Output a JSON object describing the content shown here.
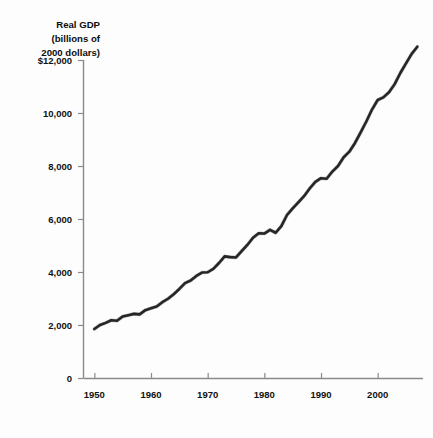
{
  "chart_data": {
    "type": "line",
    "title": "",
    "axis_title_lines": [
      "Real GDP",
      "(billions of",
      "2000 dollars)"
    ],
    "xlabel": "",
    "ylabel": "Real GDP (billions of 2000 dollars)",
    "xlim": [
      1948,
      2008
    ],
    "ylim": [
      0,
      12000
    ],
    "grid": false,
    "legend": "none",
    "line_color": "#262626",
    "axis_color": "#8a8a8a",
    "background_color": "#fdfdfd",
    "ytick_labels": [
      "$12,000",
      "10,000",
      "8,000",
      "6,000",
      "4,000",
      "2,000",
      "0"
    ],
    "ytick_values": [
      12000,
      10000,
      8000,
      6000,
      4000,
      2000,
      0
    ],
    "xtick_labels": [
      "1950",
      "1960",
      "1970",
      "1980",
      "1990",
      "2000"
    ],
    "xtick_values": [
      1950,
      1960,
      1970,
      1980,
      1990,
      2000
    ],
    "series": [
      {
        "name": "Real GDP",
        "x": [
          1950,
          1951,
          1952,
          1953,
          1954,
          1955,
          1956,
          1957,
          1958,
          1959,
          1960,
          1961,
          1962,
          1963,
          1964,
          1965,
          1966,
          1967,
          1968,
          1969,
          1970,
          1971,
          1972,
          1973,
          1974,
          1975,
          1976,
          1977,
          1978,
          1979,
          1980,
          1981,
          1982,
          1983,
          1984,
          1985,
          1986,
          1987,
          1988,
          1989,
          1990,
          1991,
          1992,
          1993,
          1994,
          1995,
          1996,
          1997,
          1998,
          1999,
          2000,
          2001,
          2002,
          2003,
          2004,
          2005,
          2006,
          2007
        ],
        "values": [
          1850,
          2000,
          2080,
          2180,
          2160,
          2320,
          2370,
          2420,
          2400,
          2560,
          2630,
          2700,
          2860,
          2990,
          3160,
          3360,
          3580,
          3680,
          3850,
          3980,
          3990,
          4120,
          4340,
          4590,
          4560,
          4550,
          4790,
          5020,
          5290,
          5460,
          5450,
          5590,
          5480,
          5730,
          6150,
          6400,
          6630,
          6860,
          7150,
          7400,
          7540,
          7520,
          7790,
          8000,
          8330,
          8540,
          8870,
          9270,
          9680,
          10130,
          10490,
          10590,
          10780,
          11090,
          11510,
          11870,
          12230,
          12500
        ]
      }
    ],
    "annotations": []
  },
  "geometry": {
    "plot_left": 83,
    "plot_right": 423,
    "plot_top": 60,
    "plot_bottom": 378,
    "year_min": 1948,
    "year_max": 2008,
    "value_max": 12000
  }
}
